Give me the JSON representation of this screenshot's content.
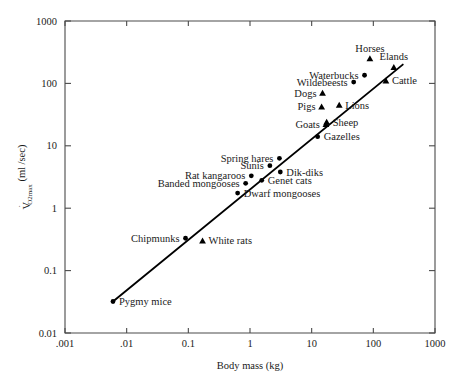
{
  "chart_data": {
    "type": "scatter",
    "title": "",
    "xlabel": "Body mass (kg)",
    "ylabel": "V̇O2max (ml /sec)",
    "ylabel_main": "V",
    "ylabel_sub": "O2max",
    "ylabel_rest": " (ml /sec)",
    "xscale": "log",
    "yscale": "log",
    "xlim": [
      0.001,
      1000
    ],
    "ylim": [
      0.01,
      1000
    ],
    "xticks": [
      ".001",
      ".01",
      "0.1",
      "1",
      "10",
      "100",
      "1000"
    ],
    "xtick_values": [
      0.001,
      0.01,
      0.1,
      1,
      10,
      100,
      1000
    ],
    "yticks": [
      "0.01",
      "0.1",
      "1",
      "10",
      "100",
      "1000"
    ],
    "ytick_values": [
      0.01,
      0.1,
      1,
      10,
      100,
      1000
    ],
    "grid": false,
    "legend": "none",
    "frame": "full-box",
    "fit_line": {
      "label": "allometric regression line",
      "x_start": 0.006,
      "y_start": 0.032,
      "x_end": 300,
      "y_end": 200
    },
    "points": [
      {
        "name": "Pygmy mice",
        "x": 0.006,
        "y": 0.032,
        "marker": "circle",
        "label_pos": "right"
      },
      {
        "name": "Chipmunks",
        "x": 0.09,
        "y": 0.33,
        "marker": "circle",
        "label_pos": "left"
      },
      {
        "name": "White rats",
        "x": 0.17,
        "y": 0.3,
        "marker": "triangle",
        "label_pos": "right"
      },
      {
        "name": "Dwarf mongooses",
        "x": 0.63,
        "y": 1.75,
        "marker": "circle",
        "label_pos": "right"
      },
      {
        "name": "Banded mongooses",
        "x": 0.85,
        "y": 2.5,
        "marker": "circle",
        "label_pos": "left"
      },
      {
        "name": "Rat kangaroos",
        "x": 1.05,
        "y": 3.3,
        "marker": "circle",
        "label_pos": "left"
      },
      {
        "name": "Genet cats",
        "x": 1.55,
        "y": 2.8,
        "marker": "circle",
        "label_pos": "right"
      },
      {
        "name": "Sunis",
        "x": 2.1,
        "y": 4.8,
        "marker": "circle",
        "label_pos": "left"
      },
      {
        "name": "Dik-diks",
        "x": 3.1,
        "y": 3.8,
        "marker": "circle",
        "label_pos": "right"
      },
      {
        "name": "Spring hares",
        "x": 3.0,
        "y": 6.3,
        "marker": "circle",
        "label_pos": "left"
      },
      {
        "name": "Gazelles",
        "x": 12.5,
        "y": 14.0,
        "marker": "circle",
        "label_pos": "right"
      },
      {
        "name": "Goats",
        "x": 17.0,
        "y": 22.0,
        "marker": "triangle",
        "label_pos": "left"
      },
      {
        "name": "Sheep",
        "x": 17.5,
        "y": 24.0,
        "marker": "triangle",
        "label_pos": "right"
      },
      {
        "name": "Pigs",
        "x": 14.5,
        "y": 42.0,
        "marker": "triangle",
        "label_pos": "left"
      },
      {
        "name": "Lions",
        "x": 28.0,
        "y": 45.0,
        "marker": "triangle",
        "label_pos": "right"
      },
      {
        "name": "Dogs",
        "x": 15.0,
        "y": 70.0,
        "marker": "triangle",
        "label_pos": "left"
      },
      {
        "name": "Wildebeests",
        "x": 48.0,
        "y": 105.0,
        "marker": "circle",
        "label_pos": "left"
      },
      {
        "name": "Waterbucks",
        "x": 72.0,
        "y": 135.0,
        "marker": "circle",
        "label_pos": "left"
      },
      {
        "name": "Cattle",
        "x": 160.0,
        "y": 110.0,
        "marker": "triangle",
        "label_pos": "right"
      },
      {
        "name": "Horses",
        "x": 88.0,
        "y": 250.0,
        "marker": "triangle",
        "label_pos": "above"
      },
      {
        "name": "Elands",
        "x": 215.0,
        "y": 180.0,
        "marker": "triangle",
        "label_pos": "above"
      }
    ]
  }
}
